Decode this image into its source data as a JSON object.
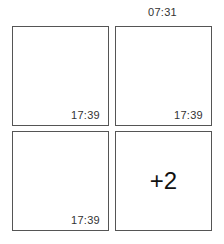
{
  "header": {
    "time": "07:31"
  },
  "grid": {
    "tiles": [
      {
        "timestamp": "17:39"
      },
      {
        "timestamp": "17:39"
      },
      {
        "timestamp": "17:39"
      },
      {
        "overflow_label": "+2"
      }
    ]
  }
}
